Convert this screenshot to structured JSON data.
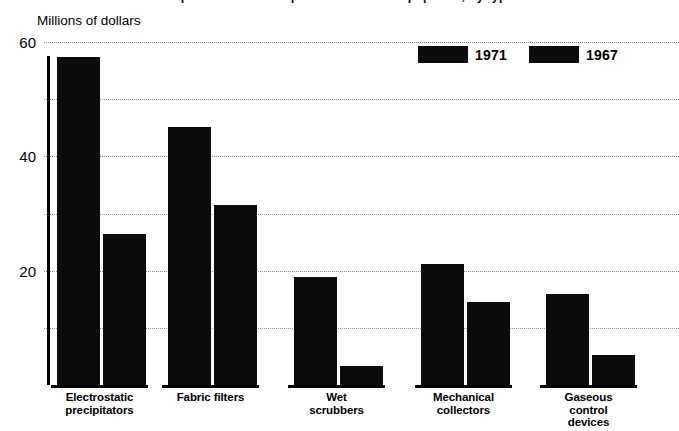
{
  "figure": {
    "title_cropped": "Expenditures for air pollution control equipment, by type",
    "unit_label": "Millions of dollars"
  },
  "legend": {
    "position": "top-right",
    "items": [
      {
        "label": "1971",
        "color": "#0b0b0b",
        "swatch": "filled-rect-swatch"
      },
      {
        "label": "1967",
        "color": "#0b0b0b",
        "swatch": "filled-rect-swatch"
      }
    ]
  },
  "axis": {
    "y_major_ticks": [
      "60",
      "40",
      "20"
    ],
    "y_minor_values": [
      50,
      30,
      10
    ],
    "y_min": 0,
    "y_max": 60
  },
  "chart_data": {
    "type": "bar",
    "title": "Expenditures for air pollution control equipment, by type",
    "xlabel": "",
    "ylabel": "Millions of dollars",
    "ylim": [
      0,
      60
    ],
    "yticks": [
      20,
      40,
      60
    ],
    "minor_gridlines": [
      10,
      30,
      50
    ],
    "grid": true,
    "legend_position": "top-right",
    "categories": [
      "Electrostatic precipitators",
      "Fabric filters",
      "Wet scrubbers",
      "Mechanical collectors",
      "Gaseous control devices"
    ],
    "series": [
      {
        "name": "1971",
        "color": "#0b0b0b",
        "values": [
          57.3,
          45.2,
          18.9,
          21.2,
          15.9
        ]
      },
      {
        "name": "1967",
        "color": "#0b0b0b",
        "values": [
          26.4,
          31.5,
          3.3,
          14.6,
          5.3
        ]
      }
    ]
  },
  "categories_display": [
    {
      "line1": "Electrostatic",
      "line2": "precipitators",
      "line3": ""
    },
    {
      "line1": "Fabric filters",
      "line2": "",
      "line3": ""
    },
    {
      "line1": "Wet",
      "line2": "scrubbers",
      "line3": ""
    },
    {
      "line1": "Mechanical",
      "line2": "collectors",
      "line3": ""
    },
    {
      "line1": "Gaseous",
      "line2": "control",
      "line3": "devices"
    }
  ]
}
